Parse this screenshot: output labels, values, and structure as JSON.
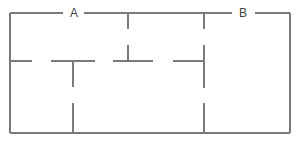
{
  "diagram": {
    "type": "floor-plan",
    "labels": [
      {
        "id": "opening-a",
        "text": "A"
      },
      {
        "id": "opening-b",
        "text": "B"
      }
    ],
    "colors": {
      "wall": "#7a7a7a",
      "label": "#444444",
      "background": "#ffffff"
    }
  }
}
